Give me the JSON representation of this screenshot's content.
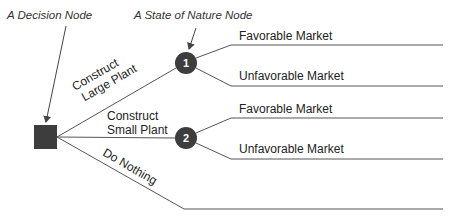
{
  "annotations": {
    "decision_node_label": "A Decision Node",
    "state_node_label": "A State of Nature Node"
  },
  "decision_node": {
    "shape": "square",
    "color": "#3d3d3d"
  },
  "alternatives": [
    {
      "label_line1": "Construct",
      "label_line2": "Large Plant",
      "leads_to": "1"
    },
    {
      "label_line1": "Construct",
      "label_line2": "Small Plant",
      "leads_to": "2"
    },
    {
      "label_line1": "Do Nothing",
      "label_line2": "",
      "leads_to": ""
    }
  ],
  "state_nodes": [
    {
      "number": "1",
      "color": "#3d3d3d",
      "outcomes": [
        {
          "label": "Favorable Market"
        },
        {
          "label": "Unfavorable Market"
        }
      ]
    },
    {
      "number": "2",
      "color": "#3d3d3d",
      "outcomes": [
        {
          "label": "Favorable Market"
        },
        {
          "label": "Unfavorable Market"
        }
      ]
    }
  ]
}
